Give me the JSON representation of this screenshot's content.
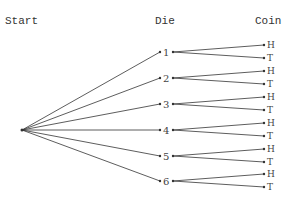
{
  "headers": {
    "start": "Start",
    "die": "Die",
    "coin": "Coin"
  },
  "die_outcomes": [
    {
      "label": "1",
      "y": 52,
      "coin": [
        {
          "label": "H",
          "y": 45
        },
        {
          "label": "T",
          "y": 58
        }
      ]
    },
    {
      "label": "2",
      "y": 78,
      "coin": [
        {
          "label": "H",
          "y": 71
        },
        {
          "label": "T",
          "y": 84
        }
      ]
    },
    {
      "label": "3",
      "y": 104,
      "coin": [
        {
          "label": "H",
          "y": 97
        },
        {
          "label": "T",
          "y": 110
        }
      ]
    },
    {
      "label": "4",
      "y": 130,
      "coin": [
        {
          "label": "H",
          "y": 123
        },
        {
          "label": "T",
          "y": 136
        }
      ]
    },
    {
      "label": "5",
      "y": 156,
      "coin": [
        {
          "label": "H",
          "y": 149
        },
        {
          "label": "T",
          "y": 162
        }
      ]
    },
    {
      "label": "6",
      "y": 181,
      "coin": [
        {
          "label": "H",
          "y": 174
        },
        {
          "label": "T",
          "y": 187
        }
      ]
    }
  ],
  "colors": {
    "line": "#333333",
    "text": "#444444",
    "background": "#ffffff"
  }
}
